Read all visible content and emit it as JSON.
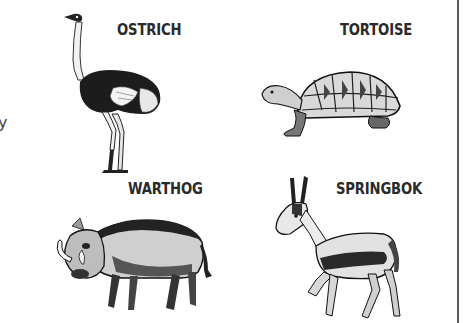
{
  "animals": [
    {
      "id": "ostrich",
      "label": "OSTRICH",
      "icon": "ostrich-illustration"
    },
    {
      "id": "tortoise",
      "label": "TORTOISE",
      "icon": "tortoise-illustration"
    },
    {
      "id": "warthog",
      "label": "WARTHOG",
      "icon": "warthog-illustration"
    },
    {
      "id": "springbok",
      "label": "SPRINGBOK",
      "icon": "springbok-illustration"
    }
  ],
  "edge_mark": "y",
  "colors": {
    "text": "#2a2a2a",
    "ink": "#1a1a1a",
    "border": "#5a5a5a",
    "background": "#ffffff"
  }
}
